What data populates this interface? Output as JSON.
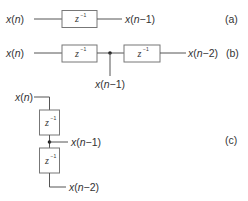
{
  "diagram": {
    "delay_symbol": {
      "base": "z",
      "exponent": "−1"
    },
    "panels": [
      {
        "id": "a",
        "tag": "(a)",
        "input": "x(n)",
        "outputs": [
          "x(n−1)"
        ]
      },
      {
        "id": "b",
        "tag": "(b)",
        "input": "x(n)",
        "tap": "x(n−1)",
        "outputs": [
          "x(n−2)"
        ]
      },
      {
        "id": "c",
        "tag": "(c)",
        "input": "x(n)",
        "tap": "x(n−1)",
        "outputs": [
          "x(n−2)"
        ]
      }
    ],
    "colors": {
      "line": "#555555",
      "box_border": "#777777",
      "text": "#333333",
      "dot": "#222222"
    }
  }
}
